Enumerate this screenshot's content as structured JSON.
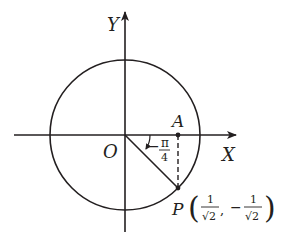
{
  "diagram": {
    "type": "unit-circle",
    "colors": {
      "stroke": "#231f20",
      "background": "#ffffff"
    },
    "axes": {
      "x_label": "X",
      "y_label": "Y",
      "origin_label": "O"
    },
    "points": {
      "A": {
        "label": "A"
      },
      "P": {
        "label": "P",
        "x_num": "1",
        "x_den": "√2",
        "comma": ",",
        "y_sign": "−",
        "y_num": "1",
        "y_den": "√2",
        "open_paren": "(",
        "close_paren": ")"
      }
    },
    "angle": {
      "sign": "−",
      "numerator": "π",
      "denominator": "4"
    }
  }
}
